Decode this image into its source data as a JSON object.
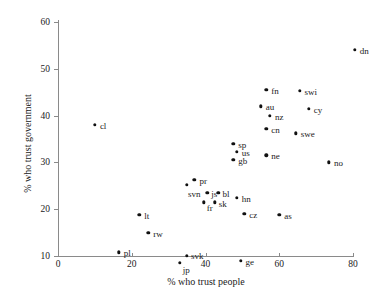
{
  "chart_data": {
    "type": "scatter",
    "title": "",
    "xlabel": "% who trust people",
    "ylabel": "% who trust government",
    "xlim": [
      -2,
      82
    ],
    "ylim": [
      6,
      62
    ],
    "xticks": [
      0,
      20,
      40,
      60,
      80
    ],
    "yticks": [
      10,
      20,
      30,
      40,
      50,
      60
    ],
    "grid": false,
    "legend": null,
    "marker_color": "#111111",
    "axis_color": "#8a8a8a",
    "points": [
      {
        "label": "dn",
        "x": 80.5,
        "y": 54.0,
        "lx": 5,
        "ly": -3
      },
      {
        "label": "fn",
        "x": 56.5,
        "y": 45.5,
        "lx": 5,
        "ly": -3
      },
      {
        "label": "swi",
        "x": 65.5,
        "y": 45.3,
        "lx": 5,
        "ly": -3
      },
      {
        "label": "au",
        "x": 55.0,
        "y": 42.0,
        "lx": 5,
        "ly": -3
      },
      {
        "label": "cy",
        "x": 68.0,
        "y": 41.5,
        "lx": 5,
        "ly": -3
      },
      {
        "label": "nz",
        "x": 57.5,
        "y": 40.0,
        "lx": 5,
        "ly": -3
      },
      {
        "label": "cn",
        "x": 56.5,
        "y": 37.2,
        "lx": 5,
        "ly": -3
      },
      {
        "label": "swe",
        "x": 64.5,
        "y": 36.2,
        "lx": 5,
        "ly": -3
      },
      {
        "label": "sp",
        "x": 47.5,
        "y": 34.0,
        "lx": 5,
        "ly": -3
      },
      {
        "label": "cl",
        "x": 10.0,
        "y": 38.0,
        "lx": 5,
        "ly": -3
      },
      {
        "label": "us",
        "x": 48.5,
        "y": 32.2,
        "lx": 5,
        "ly": -3
      },
      {
        "label": "ne",
        "x": 56.5,
        "y": 31.5,
        "lx": 5,
        "ly": -3
      },
      {
        "label": "gb",
        "x": 47.5,
        "y": 30.5,
        "lx": 5,
        "ly": -3
      },
      {
        "label": "no",
        "x": 73.5,
        "y": 30.0,
        "lx": 5,
        "ly": -3
      },
      {
        "label": "pr",
        "x": 37.0,
        "y": 26.3,
        "lx": 5,
        "ly": -3
      },
      {
        "label": "svn",
        "x": 35.0,
        "y": 25.2,
        "lx": 1,
        "ly": 5
      },
      {
        "label": "js",
        "x": 40.5,
        "y": 23.5,
        "lx": 4,
        "ly": -3
      },
      {
        "label": "bl",
        "x": 43.5,
        "y": 23.5,
        "lx": 4,
        "ly": -3
      },
      {
        "label": "hn",
        "x": 48.5,
        "y": 22.5,
        "lx": 5,
        "ly": -3
      },
      {
        "label": "fr",
        "x": 39.5,
        "y": 21.5,
        "lx": 3,
        "ly": 2
      },
      {
        "label": "sk",
        "x": 42.5,
        "y": 21.5,
        "lx": 4,
        "ly": -2
      },
      {
        "label": "cz",
        "x": 50.5,
        "y": 19.0,
        "lx": 5,
        "ly": -3
      },
      {
        "label": "as",
        "x": 60.0,
        "y": 18.8,
        "lx": 5,
        "ly": -3
      },
      {
        "label": "lt",
        "x": 22.0,
        "y": 18.8,
        "lx": 5,
        "ly": -3
      },
      {
        "label": "rw",
        "x": 24.5,
        "y": 15.0,
        "lx": 5,
        "ly": -3
      },
      {
        "label": "pl",
        "x": 16.5,
        "y": 10.8,
        "lx": 5,
        "ly": -3
      },
      {
        "label": "svk",
        "x": 35.0,
        "y": 10.0,
        "lx": 4,
        "ly": -4
      },
      {
        "label": "ge",
        "x": 49.5,
        "y": 9.0,
        "lx": 5,
        "ly": -3
      },
      {
        "label": "jp",
        "x": 33.0,
        "y": 8.6,
        "lx": 3,
        "ly": 3
      }
    ]
  }
}
